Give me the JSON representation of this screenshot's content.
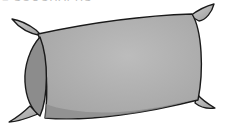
{
  "caption": {
    "text": "■ SOUCHAPHS",
    "note_visible": "cropped"
  },
  "illustration": {
    "subject": "pillow",
    "icon": "pillow-icon",
    "colors": {
      "outline": "#1a1a1a",
      "body": "#aaaaaa",
      "body_highlight": "#bcbcbc",
      "side_face": "#8c8c8c",
      "ear": "#a6a6a6",
      "ear_highlight": "#d0d0d0",
      "shadow": "#7e7e7e",
      "background": "#ffffff"
    }
  }
}
